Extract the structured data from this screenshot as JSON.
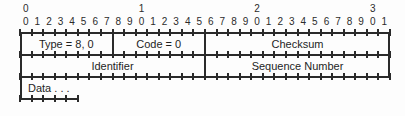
{
  "diagram": {
    "type": "packet-header-layout",
    "bit_width": 32,
    "colors": {
      "line": "#2a2a2a",
      "text": "#1e1e1e",
      "background": "#fdfdfd"
    },
    "ruler": {
      "decade_labels": [
        {
          "bit": 0,
          "text": "0"
        },
        {
          "bit": 10,
          "text": "1"
        },
        {
          "bit": 20,
          "text": "2"
        },
        {
          "bit": 30,
          "text": "3"
        }
      ],
      "unit_labels": [
        "0",
        "1",
        "2",
        "3",
        "4",
        "5",
        "6",
        "7",
        "8",
        "9",
        "0",
        "1",
        "2",
        "3",
        "4",
        "5",
        "6",
        "7",
        "8",
        "9",
        "0",
        "1",
        "2",
        "3",
        "4",
        "5",
        "6",
        "7",
        "8",
        "9",
        "0",
        "1"
      ]
    },
    "rows": [
      {
        "index": 0,
        "fields": [
          {
            "label": "Type = 8, 0",
            "start_bit": 0,
            "bits": 8,
            "align": "center"
          },
          {
            "label": "Code = 0",
            "start_bit": 8,
            "bits": 8,
            "align": "center"
          },
          {
            "label": "Checksum",
            "start_bit": 16,
            "bits": 16,
            "align": "center"
          }
        ]
      },
      {
        "index": 1,
        "fields": [
          {
            "label": "Identifier",
            "start_bit": 0,
            "bits": 16,
            "align": "center"
          },
          {
            "label": "Sequence Number",
            "start_bit": 16,
            "bits": 16,
            "align": "center"
          }
        ]
      },
      {
        "index": 2,
        "truncated": true,
        "fields": [
          {
            "label": "Data . . .",
            "start_bit": 0,
            "bits": 32,
            "align": "left"
          }
        ]
      }
    ]
  }
}
